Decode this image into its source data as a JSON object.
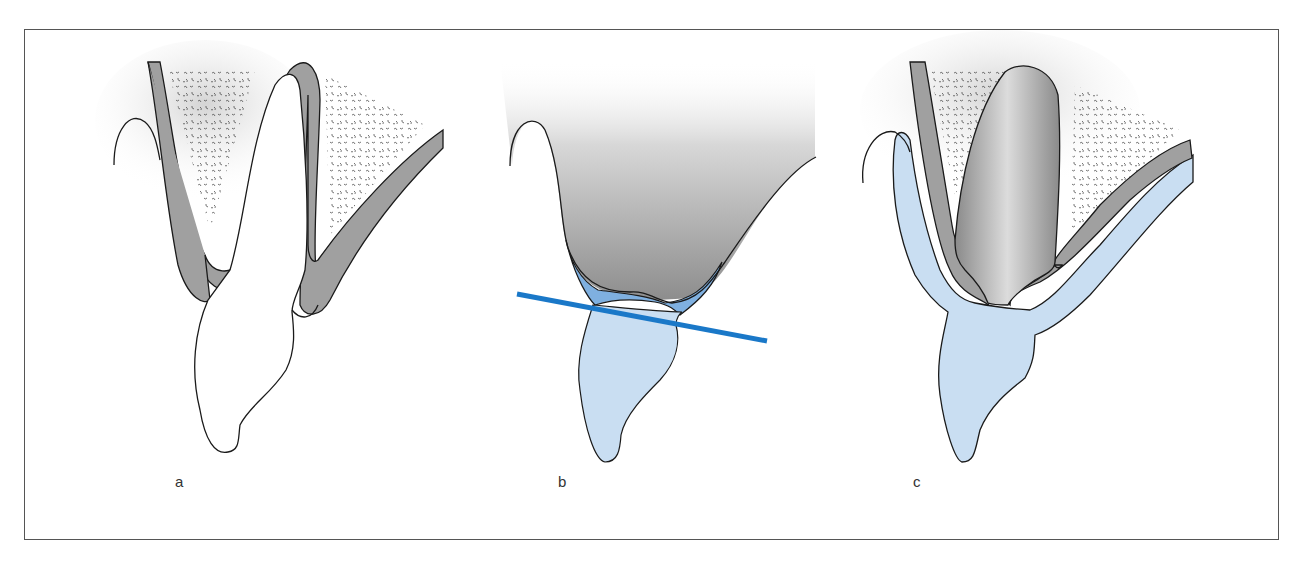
{
  "figure": {
    "panels": [
      {
        "id": "a",
        "label": "a",
        "description": "Natural tooth in alveolar socket with gingiva and bone"
      },
      {
        "id": "b",
        "label": "b",
        "description": "Tooth crown sectioned along a horizontal cutting line"
      },
      {
        "id": "c",
        "label": "c",
        "description": "Ovate pontic in socket with soft tissue contour"
      }
    ],
    "colors": {
      "outline": "#1a1a1a",
      "gingiva_gray": "#9a9a9a",
      "light_blue": "#c9def2",
      "medium_blue": "#7fb0e0",
      "cut_line_blue": "#1a78c8",
      "frame": "#555555"
    }
  }
}
